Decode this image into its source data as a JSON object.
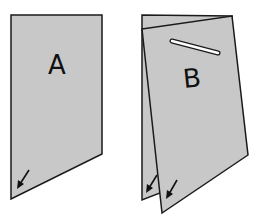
{
  "diagram": {
    "panels": [
      {
        "id": "A",
        "label": "A",
        "description": "single flat sheet with arrow at bottom-left corner"
      },
      {
        "id": "B",
        "label": "B",
        "description": "folded sheet with slot near top and arrows on both bottom-left corners"
      }
    ],
    "colors": {
      "paper": "#c8c8c8",
      "outline": "#1a1a1a",
      "background": "#ffffff"
    },
    "arrows": {
      "A": 1,
      "B": 2
    }
  }
}
